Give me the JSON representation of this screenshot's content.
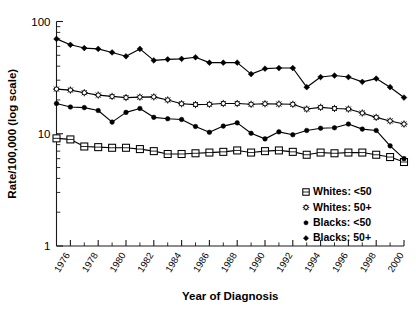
{
  "chart_data": {
    "type": "line",
    "title": "",
    "xlabel": "Year of Diagnosis",
    "ylabel": "Rate/100,000 (log scale)",
    "yscale": "log",
    "ylim": [
      1,
      100
    ],
    "ytick_labels": [
      "100",
      "10",
      "1"
    ],
    "ytick_values": [
      100,
      10,
      1
    ],
    "grid": false,
    "legend_position": "bottom-right",
    "x": [
      1975,
      1976,
      1977,
      1978,
      1979,
      1980,
      1981,
      1982,
      1983,
      1984,
      1985,
      1986,
      1987,
      1988,
      1989,
      1990,
      1991,
      1992,
      1993,
      1994,
      1995,
      1996,
      1997,
      1998,
      1999,
      2000
    ],
    "xtick_labels": [
      "1976",
      "1978",
      "1980",
      "1982",
      "1984",
      "1986",
      "1988",
      "1990",
      "1992",
      "1994",
      "1996",
      "1998",
      "2000"
    ],
    "xtick_values": [
      1976,
      1978,
      1980,
      1982,
      1984,
      1986,
      1988,
      1990,
      1992,
      1994,
      1996,
      1998,
      2000
    ],
    "series": [
      {
        "name": "Whites: <50",
        "marker": "open-square",
        "values": [
          9.1,
          8.9,
          7.7,
          7.6,
          7.5,
          7.5,
          7.3,
          7.0,
          6.6,
          6.6,
          6.7,
          6.8,
          6.9,
          7.1,
          6.8,
          7.0,
          7.1,
          6.9,
          6.5,
          6.8,
          6.7,
          6.8,
          6.8,
          6.5,
          6.2,
          5.6
        ]
      },
      {
        "name": "Whites: 50+",
        "marker": "open-star",
        "values": [
          25.0,
          24.5,
          23.2,
          22.1,
          21.5,
          21.0,
          21.2,
          21.3,
          20.0,
          18.5,
          18.2,
          18.3,
          18.6,
          18.6,
          18.3,
          18.5,
          18.4,
          18.3,
          16.6,
          17.2,
          16.8,
          16.6,
          15.3,
          14.0,
          13.0,
          12.2
        ]
      },
      {
        "name": "Blacks: <50",
        "marker": "filled-circle",
        "values": [
          18.6,
          17.3,
          17.1,
          16.1,
          12.7,
          15.5,
          16.8,
          14.0,
          13.6,
          13.4,
          11.6,
          10.3,
          11.7,
          12.5,
          10.1,
          9.0,
          10.4,
          9.8,
          10.7,
          11.2,
          11.3,
          12.2,
          11.0,
          10.7,
          7.8,
          6.0
        ]
      },
      {
        "name": "Blacks: 50+",
        "marker": "filled-diamond",
        "values": [
          70.0,
          62.0,
          58.0,
          57.0,
          53.0,
          49.0,
          57.0,
          45.0,
          46.0,
          46.5,
          48.0,
          43.0,
          43.0,
          43.0,
          34.0,
          38.0,
          38.5,
          38.5,
          26.0,
          32.0,
          33.0,
          32.0,
          29.0,
          31.0,
          26.0,
          21.0
        ]
      }
    ],
    "legend_entries": [
      {
        "marker": "open-square",
        "label": "Whites: <50"
      },
      {
        "marker": "open-star",
        "label": "Whites:  50+"
      },
      {
        "marker": "filled-circle",
        "label": "Blacks: <50"
      },
      {
        "marker": "filled-diamond",
        "label": "Blacks:  50+"
      }
    ]
  },
  "colors": {
    "ink": "#000000",
    "axis": "#1a1a1a",
    "background": "#ffffff"
  }
}
